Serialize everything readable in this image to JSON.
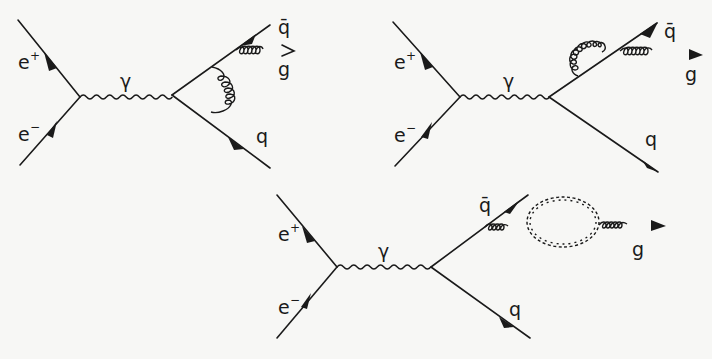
{
  "figure": {
    "diagrams": [
      {
        "id": "vertex-correction",
        "labels": {
          "e_plus": "e",
          "e_plus_sup": "+",
          "e_minus": "e",
          "e_minus_sup": "−",
          "photon": "γ",
          "qbar": "q̄",
          "gluon": "g",
          "quark": "q"
        }
      },
      {
        "id": "self-energy-correction",
        "labels": {
          "e_plus": "e",
          "e_plus_sup": "+",
          "e_minus": "e",
          "e_minus_sup": "−",
          "photon": "γ",
          "qbar": "q̄",
          "gluon": "g",
          "quark": "q"
        }
      },
      {
        "id": "gluon-self-energy",
        "labels": {
          "e_plus": "e",
          "e_plus_sup": "+",
          "e_minus": "e",
          "e_minus_sup": "−",
          "photon": "γ",
          "qbar": "q̄",
          "gluon": "g",
          "quark": "q"
        }
      }
    ]
  }
}
